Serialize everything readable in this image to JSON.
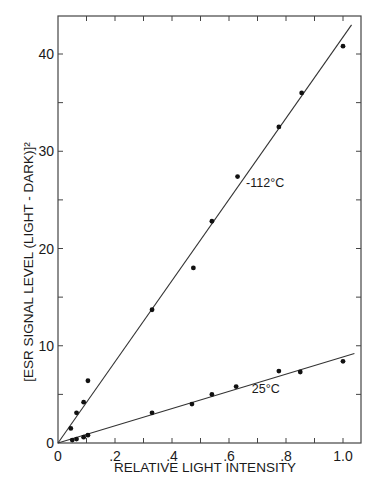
{
  "chart_data": {
    "type": "scatter",
    "title": "",
    "xlabel": "RELATIVE LIGHT INTENSITY",
    "ylabel": "[ESR SIGNAL LEVEL (LIGHT - DARK)]²",
    "xlim": [
      0,
      1.05
    ],
    "ylim": [
      0,
      43
    ],
    "grid": false,
    "legend": "none (inline line labels)",
    "x_ticks": [
      0,
      0.2,
      0.4,
      0.6,
      0.8,
      1.0
    ],
    "x_tick_labels": [
      "0",
      ".2",
      ".4",
      ".6",
      ".8",
      "1.0"
    ],
    "y_ticks": [
      0,
      10,
      20,
      30,
      40
    ],
    "y_tick_labels": [
      "0",
      "10",
      "20",
      "30",
      "40"
    ],
    "series": [
      {
        "name": "-112°C",
        "label_text": "-112°C",
        "points": [
          [
            0.045,
            1.5
          ],
          [
            0.065,
            3.1
          ],
          [
            0.09,
            4.2
          ],
          [
            0.105,
            6.4
          ],
          [
            0.33,
            13.7
          ],
          [
            0.475,
            18.0
          ],
          [
            0.54,
            22.8
          ],
          [
            0.63,
            27.4
          ],
          [
            0.775,
            32.5
          ],
          [
            0.855,
            36.0
          ],
          [
            1.0,
            40.8
          ]
        ],
        "fit_line": {
          "from": [
            0,
            0
          ],
          "to": [
            1.03,
            43.0
          ]
        }
      },
      {
        "name": "25°C",
        "label_text": "25°C",
        "points": [
          [
            0.05,
            0.3
          ],
          [
            0.065,
            0.4
          ],
          [
            0.09,
            0.6
          ],
          [
            0.105,
            0.8
          ],
          [
            0.33,
            3.1
          ],
          [
            0.47,
            4.0
          ],
          [
            0.54,
            5.0
          ],
          [
            0.625,
            5.8
          ],
          [
            0.775,
            7.4
          ],
          [
            0.85,
            7.3
          ],
          [
            1.0,
            8.4
          ]
        ],
        "fit_line": {
          "from": [
            0,
            0
          ],
          "to": [
            1.04,
            9.2
          ]
        }
      }
    ],
    "annotations": [
      {
        "text": "-112°C",
        "x": 0.66,
        "y": 26.3
      },
      {
        "text": "25°C",
        "x": 0.68,
        "y": 5.1
      }
    ]
  },
  "colors": {
    "axis": "#444444",
    "line": "#333333",
    "point": "#111111",
    "text": "#1a1a1a"
  }
}
